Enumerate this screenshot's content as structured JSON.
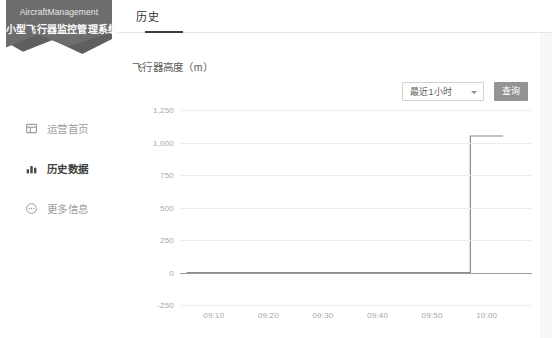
{
  "sidebar": {
    "logo": {
      "english": "AircraftManagement",
      "chinese": "小型飞行器监控管理系统",
      "bg_color": "#5f5f5f"
    },
    "items": [
      {
        "label": "运营首页",
        "icon": "dashboard-icon",
        "active": false
      },
      {
        "label": "历史数据",
        "icon": "bar-chart-icon",
        "active": true
      },
      {
        "label": "更多信息",
        "icon": "more-circle-icon",
        "active": false
      }
    ]
  },
  "tabs": [
    {
      "label": "历史",
      "active": true
    }
  ],
  "toolbar": {
    "range_select_value": "最近1小时",
    "query_label": "查询",
    "query_color": "#949494"
  },
  "chart_data": {
    "type": "line",
    "title": "飞行器高度（m）",
    "xlabel": "",
    "ylabel": "",
    "ylim": [
      -250,
      1250
    ],
    "yticks": [
      1250,
      1000,
      750,
      500,
      250,
      0,
      -250
    ],
    "ytick_labels": [
      "1,250",
      "1,000",
      "750",
      "500",
      "250",
      "0",
      "-250"
    ],
    "xticks": [
      "09:10",
      "09:20",
      "09:30",
      "09:40",
      "09:50",
      "10:00"
    ],
    "grid": "horizontal",
    "legend": "none",
    "line_color": "#8a8a8a",
    "series": [
      {
        "name": "飞行器高度",
        "x": [
          "09:05",
          "09:10",
          "09:20",
          "09:30",
          "09:40",
          "09:50",
          "09:57",
          "09:57",
          "10:00",
          "10:03"
        ],
        "values": [
          0,
          0,
          0,
          0,
          0,
          0,
          0,
          1050,
          1050,
          1050
        ]
      }
    ]
  }
}
